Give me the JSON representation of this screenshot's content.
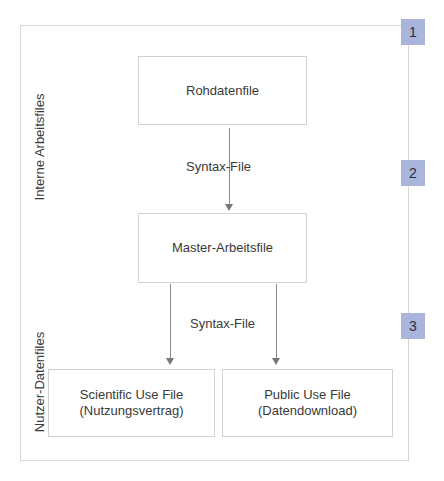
{
  "diagram": {
    "sections": [
      {
        "label": "Interne Arbeitsfiles"
      },
      {
        "label": "Nutzer-Datenfiles"
      }
    ],
    "badges": [
      "1",
      "2",
      "3"
    ],
    "nodes": {
      "raw": "Rohdatenfile",
      "master": "Master-Arbeitsfile",
      "scientific_line1": "Scientific Use File",
      "scientific_line2": "(Nutzungsvertrag)",
      "public_line1": "Public Use File",
      "public_line2": "(Datendownload)"
    },
    "edges": {
      "raw_to_master_label": "Syntax-File",
      "master_to_users_label": "Syntax-File"
    },
    "colors": {
      "badge": "#a9b5da",
      "frame": "#d6d6d6",
      "arrow": "#8a8a8a"
    }
  }
}
